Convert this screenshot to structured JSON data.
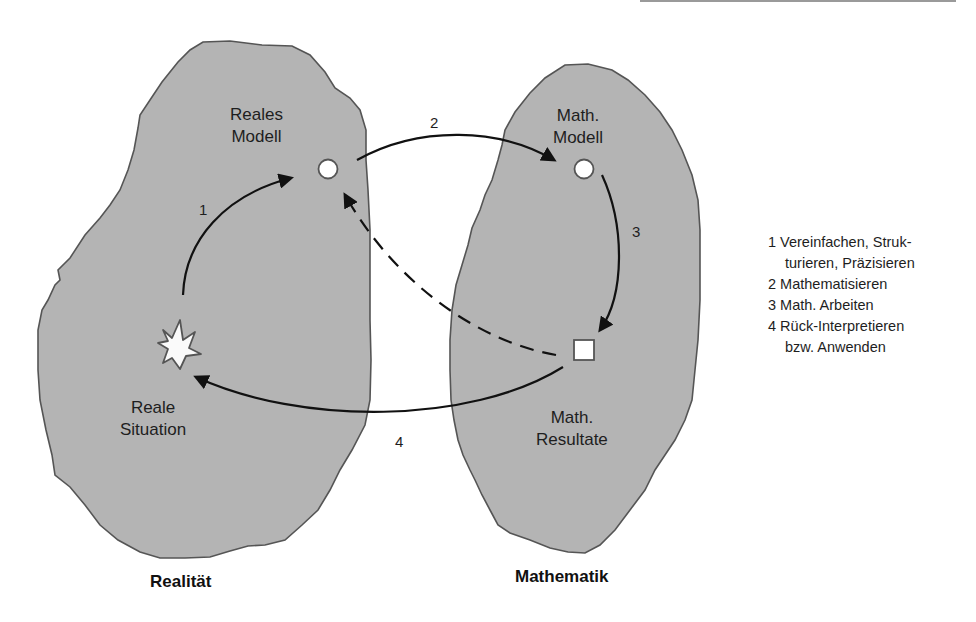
{
  "diagram": {
    "type": "modelling-cycle",
    "colors": {
      "region_fill": "#b4b4b4",
      "region_stroke": "#555555",
      "arrow": "#111111",
      "node_fill": "#ffffff",
      "background": "#ffffff"
    },
    "regions": [
      {
        "id": "realitaet",
        "label": "Realität"
      },
      {
        "id": "mathematik",
        "label": "Mathematik"
      }
    ],
    "nodes": {
      "reale_situation": {
        "line1": "Reale",
        "line2": "Situation",
        "shape": "star"
      },
      "reales_modell": {
        "line1": "Reales",
        "line2": "Modell",
        "shape": "circle"
      },
      "math_modell": {
        "line1": "Math.",
        "line2": "Modell",
        "shape": "circle"
      },
      "math_resultate": {
        "line1": "Math.",
        "line2": "Resultate",
        "shape": "square"
      }
    },
    "arrows": [
      {
        "label": "1",
        "from": "reale_situation",
        "to": "reales_modell",
        "style": "solid"
      },
      {
        "label": "2",
        "from": "reales_modell",
        "to": "math_modell",
        "style": "solid"
      },
      {
        "label": "3",
        "from": "math_modell",
        "to": "math_resultate",
        "style": "solid"
      },
      {
        "label": "4",
        "from": "math_resultate",
        "to": "reale_situation",
        "style": "solid"
      },
      {
        "label": "",
        "from": "math_resultate",
        "to": "reales_modell",
        "style": "dashed"
      }
    ]
  },
  "legend": {
    "items": [
      {
        "line1": "1 Vereinfachen, Struk-",
        "line2": "turieren, Präzisieren"
      },
      {
        "line1": "2 Mathematisieren"
      },
      {
        "line1": "3 Math. Arbeiten"
      },
      {
        "line1": "4 Rück-Interpretieren",
        "line2": "bzw. Anwenden"
      }
    ]
  }
}
